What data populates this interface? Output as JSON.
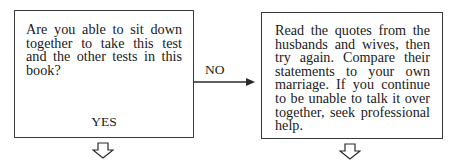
{
  "flowchart": {
    "question_box": {
      "text": "Are you able to sit down together to take this test and the other tests in this book?",
      "yes_label": "YES"
    },
    "no_branch": {
      "label": "NO"
    },
    "advice_box": {
      "text": "Read the quotes from the husbands and wives, then try again. Compare their statements to your own marriage. If you continue to be unable to talk it over together, seek professional help."
    },
    "icons": {
      "right_arrow": "arrow-right-icon",
      "down_arrow_left": "hollow-down-arrow-icon",
      "down_arrow_right": "hollow-down-arrow-icon"
    }
  }
}
